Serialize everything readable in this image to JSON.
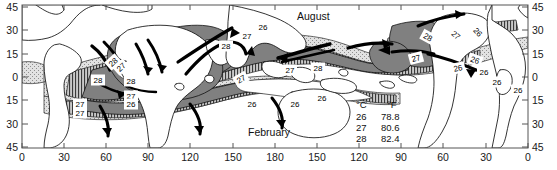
{
  "figure": {
    "kind": "world-map-contour"
  },
  "axes": {
    "left_ticks": [
      "45",
      "30",
      "15",
      "0",
      "15",
      "30",
      "45"
    ],
    "right_ticks": [
      "45",
      "30",
      "15",
      "0",
      "15",
      "30",
      "45"
    ],
    "bottom_ticks": [
      "0",
      "30",
      "60",
      "90",
      "120",
      "150",
      "180",
      "150",
      "120",
      "90",
      "60",
      "30",
      "0"
    ],
    "top_ticks": [
      "",
      "",
      "",
      "",
      "",
      "",
      "",
      "",
      "",
      "",
      "",
      "",
      ""
    ]
  },
  "season_labels": {
    "august": "August",
    "february": "February"
  },
  "legend": {
    "header_c": "°C",
    "header_f": "°F",
    "rows": [
      {
        "c": "26",
        "f": "78.8"
      },
      {
        "c": "27",
        "f": "80.6"
      },
      {
        "c": "28",
        "f": "82.4"
      }
    ]
  },
  "contour_labels": [
    {
      "id": "c1",
      "text": "28"
    },
    {
      "id": "c2",
      "text": "28"
    },
    {
      "id": "c3",
      "text": "27"
    },
    {
      "id": "c4",
      "text": "26"
    },
    {
      "id": "c5",
      "text": "26"
    },
    {
      "id": "c6",
      "text": "27"
    },
    {
      "id": "c7",
      "text": "26"
    },
    {
      "id": "c8",
      "text": "28"
    },
    {
      "id": "c9",
      "text": "27"
    },
    {
      "id": "c10",
      "text": "26"
    },
    {
      "id": "c11",
      "text": "26"
    },
    {
      "id": "c12",
      "text": "28"
    },
    {
      "id": "c13",
      "text": "27"
    },
    {
      "id": "c14",
      "text": "26"
    },
    {
      "id": "c15",
      "text": "28"
    },
    {
      "id": "c16",
      "text": "27"
    },
    {
      "id": "c17",
      "text": "26"
    },
    {
      "id": "c18",
      "text": "27"
    },
    {
      "id": "c19",
      "text": "26"
    },
    {
      "id": "c20",
      "text": "27"
    },
    {
      "id": "c21",
      "text": "26"
    },
    {
      "id": "c22",
      "text": "28"
    },
    {
      "id": "c23",
      "text": "27"
    },
    {
      "id": "c24",
      "text": "26"
    },
    {
      "id": "c25",
      "text": "26"
    },
    {
      "id": "c26",
      "text": "27"
    }
  ],
  "colors": {
    "frame": "#555555",
    "coastline": "#111111",
    "dark_fill": "#808080",
    "mid_fill": "#a9a9a9",
    "light_fill": "#d0d0d0",
    "arrow": "#000000",
    "background": "#ffffff"
  }
}
